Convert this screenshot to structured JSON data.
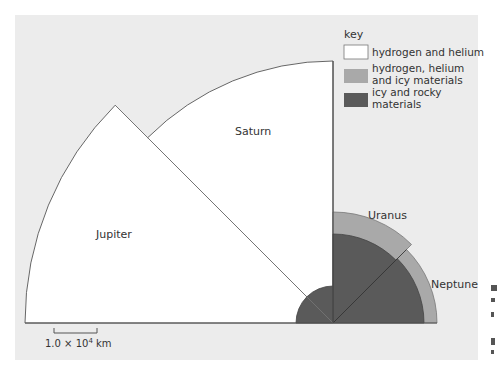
{
  "figure": {
    "panel_color": "#ececec",
    "colors": {
      "hydrogen_helium": "#ffffff",
      "hydrogen_helium_icy": "#a9a9a9",
      "icy_rocky": "#5a5a5a",
      "outline": "#666666"
    },
    "planets": [
      {
        "name": "Jupiter",
        "label": "Jupiter"
      },
      {
        "name": "Saturn",
        "label": "Saturn"
      },
      {
        "name": "Uranus",
        "label": "Uranus"
      },
      {
        "name": "Neptune",
        "label": "Neptune"
      }
    ],
    "legend": {
      "title": "key",
      "items": [
        {
          "label_line1": "hydrogen and helium",
          "label_line2": "",
          "color": "#ffffff"
        },
        {
          "label_line1": "hydrogen, helium",
          "label_line2": "and icy materials",
          "color": "#a9a9a9"
        },
        {
          "label_line1": "icy and rocky",
          "label_line2": "materials",
          "color": "#5a5a5a"
        }
      ]
    },
    "scale_bar": {
      "label_mantissa": "1.0 × 10",
      "label_exponent": "4",
      "label_unit": " km"
    }
  }
}
